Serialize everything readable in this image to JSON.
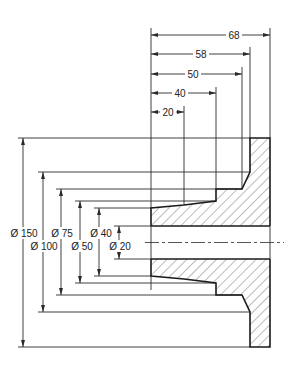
{
  "drawing": {
    "title": "Flange section with dimensions",
    "colors": {
      "line": "#2a2a2a",
      "background": "#ffffff",
      "hatch": "#555555"
    },
    "length_dimensions": [
      {
        "id": "len-68",
        "label": "68",
        "value": 68
      },
      {
        "id": "len-58",
        "label": "58",
        "value": 58
      },
      {
        "id": "len-50",
        "label": "50",
        "value": 50
      },
      {
        "id": "len-40",
        "label": "40",
        "value": 40
      },
      {
        "id": "len-20",
        "label": "20",
        "value": 20
      }
    ],
    "diameter_dimensions": [
      {
        "id": "dia-150",
        "label": "Ø 150",
        "value": 150
      },
      {
        "id": "dia-100",
        "label": "Ø 100",
        "value": 100
      },
      {
        "id": "dia-75",
        "label": "Ø 75",
        "value": 75
      },
      {
        "id": "dia-50",
        "label": "Ø 50",
        "value": 50
      },
      {
        "id": "dia-40",
        "label": "Ø 40",
        "value": 40
      },
      {
        "id": "dia-20",
        "label": "Ø 20",
        "value": 20
      }
    ]
  }
}
